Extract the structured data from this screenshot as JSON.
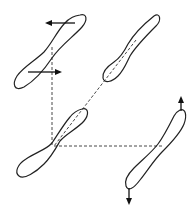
{
  "diagram": {
    "colors": {
      "stroke": "#222222",
      "background": "#ffffff"
    },
    "shapes": [
      {
        "id": "loop-top-left",
        "position": "top-left",
        "arrows": [
          "left (top)",
          "right (bottom)"
        ]
      },
      {
        "id": "loop-top-right",
        "position": "top-right",
        "arrows": []
      },
      {
        "id": "loop-center",
        "position": "bottom-left / center",
        "arrows": []
      },
      {
        "id": "loop-bottom-right",
        "position": "bottom-right",
        "arrows": [
          "up (top)",
          "down (bottom)"
        ]
      }
    ],
    "connectors": [
      {
        "type": "dashed",
        "from": "loop-top-left",
        "to": "loop-center",
        "direction": "vertical"
      },
      {
        "type": "dashed",
        "from": "loop-top-right",
        "to": "loop-center",
        "direction": "diagonal"
      },
      {
        "type": "dashed",
        "from": "loop-center",
        "to": "loop-bottom-right",
        "direction": "horizontal"
      }
    ]
  }
}
